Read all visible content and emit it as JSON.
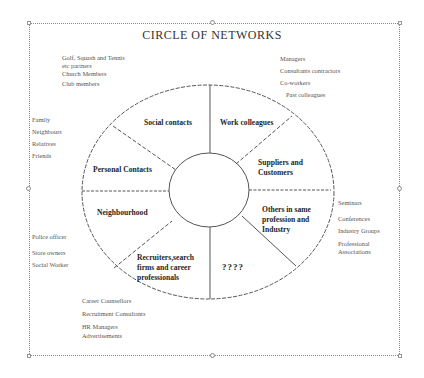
{
  "title": "CIRCLE OF NETWORKS",
  "segments": {
    "social": "Social  contacts",
    "work": "Work colleagues",
    "personal": "Personal Contacts",
    "suppliers": [
      "Suppliers and",
      "Customers"
    ],
    "neighbourhood": "Neighbourhood",
    "others": [
      "Others in same",
      "profession and",
      "Industry"
    ],
    "recruiters": [
      "Recruiters,search",
      "firms and career",
      "professionals"
    ],
    "unknown": "????"
  },
  "external_groups": {
    "social": [
      "Golf, Squash and Tennis",
      "etc partners",
      "Church  Members",
      "Club members"
    ],
    "work": [
      "Managers",
      "Consultants contractors",
      "Co-workers",
      "Past colleagues"
    ],
    "personal": [
      "Family",
      "Neighbours",
      "Relatives",
      "Friends"
    ],
    "others": [
      "Seminars",
      "Conferences",
      "Industry  Groups",
      "Professional",
      "Associations"
    ],
    "neighbourhood": [
      "Police officer",
      "Store owners",
      "Social  Worker"
    ],
    "recruiters": [
      "Career  Counsellors",
      "Recruitment Consultants",
      "HR Managers",
      "Advertisements"
    ]
  },
  "colors": {
    "line": "#555555",
    "frame": "#8a8a8a",
    "text": "#222222"
  }
}
